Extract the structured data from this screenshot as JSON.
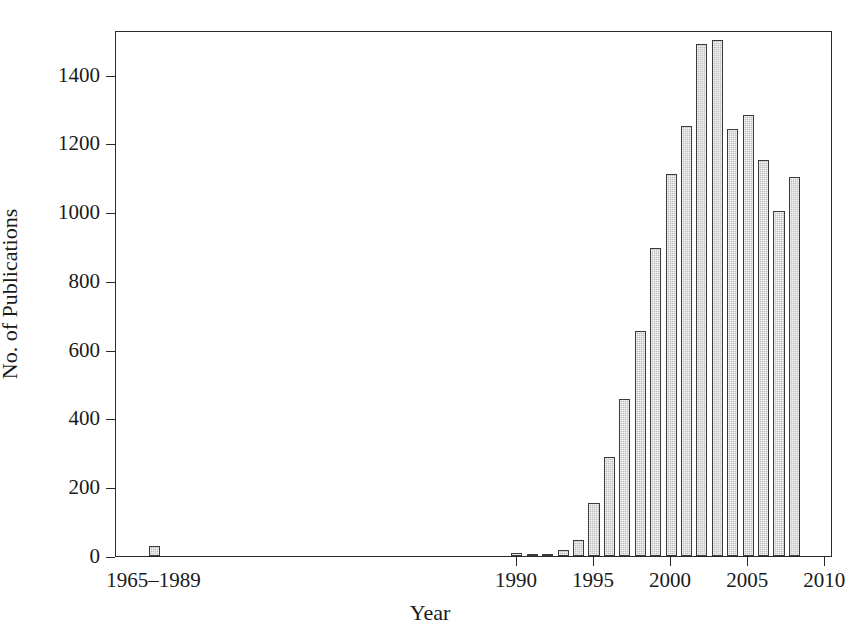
{
  "chart_data": {
    "type": "bar",
    "title": "",
    "xlabel": "Year",
    "ylabel": "No. of Publications",
    "categories": [
      "1965-1989",
      "1990",
      "1991",
      "1992",
      "1993",
      "1994",
      "1995",
      "1996",
      "1997",
      "1998",
      "1999",
      "2000",
      "2001",
      "2002",
      "2003",
      "2004",
      "2005",
      "2006",
      "2007",
      "2008"
    ],
    "values": [
      30,
      8,
      2,
      6,
      18,
      48,
      155,
      288,
      458,
      655,
      895,
      1110,
      1250,
      1488,
      1500,
      1243,
      1282,
      1152,
      1005,
      1102
    ],
    "ylim": [
      0,
      1530
    ],
    "xlim": [
      1964,
      2010.5
    ],
    "ytick_values": [
      0,
      200,
      400,
      600,
      800,
      1000,
      1200,
      1400
    ],
    "ytick_labels": [
      "0",
      "200",
      "400",
      "600",
      "800",
      "1000",
      "1200",
      "1400"
    ],
    "xtick_values": [
      1990,
      1995,
      2000,
      2005,
      2010
    ],
    "xtick_labels": [
      "1990",
      "1995",
      "2000",
      "2005",
      "2010"
    ],
    "extra_xtick_labels": [
      {
        "label": "1965–1989",
        "x": 1966.5
      }
    ],
    "grid": false,
    "legend": null,
    "bar_fill_color": "#bfbfbf",
    "bar_edge_color": "#3a3a3a",
    "axis_color": "#2b2b2b",
    "background_color": "#ffffff"
  }
}
